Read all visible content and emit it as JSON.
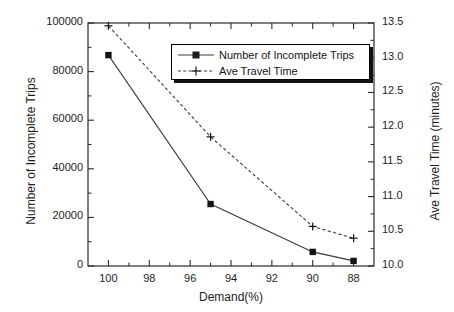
{
  "chart_data": {
    "type": "line",
    "title": "",
    "xlabel": "Demand(%)",
    "ylabel": "Number of Incomplete Trips",
    "y2label": "Ave Travel Time (minutes)",
    "x": [
      100,
      95,
      90,
      88
    ],
    "xlim": [
      101,
      87
    ],
    "xticks": [
      100,
      98,
      96,
      94,
      92,
      90,
      88
    ],
    "xticklabels": [
      "100",
      "98",
      "96",
      "94",
      "92",
      "90",
      "88"
    ],
    "ylim": [
      0,
      100000
    ],
    "yticks": [
      0,
      20000,
      40000,
      60000,
      80000,
      100000
    ],
    "yticklabels": [
      "0",
      "20000",
      "40000",
      "60000",
      "80000",
      "100000"
    ],
    "y2lim": [
      10.0,
      13.5
    ],
    "y2ticks": [
      10.0,
      10.5,
      11.0,
      11.5,
      12.0,
      12.5,
      13.0,
      13.5
    ],
    "y2ticklabels": [
      "10.0",
      "10.5",
      "11.0",
      "11.5",
      "12.0",
      "12.5",
      "13.0",
      "13.5"
    ],
    "grid": false,
    "legend_position": "upper center",
    "series": [
      {
        "name": "Number of Incomplete Trips",
        "axis": "left",
        "marker": "square",
        "linestyle": "solid",
        "color": "#3b3b3b",
        "values": [
          86800,
          25500,
          5800,
          2100
        ]
      },
      {
        "name": "Ave Travel Time",
        "axis": "right",
        "marker": "plus",
        "linestyle": "dashed",
        "color": "#3b3b3b",
        "values": [
          13.46,
          11.86,
          10.57,
          10.4
        ]
      }
    ]
  },
  "legend": {
    "items": [
      {
        "label": "Number of Incomplete Trips"
      },
      {
        "label": "Ave Travel Time"
      }
    ]
  }
}
